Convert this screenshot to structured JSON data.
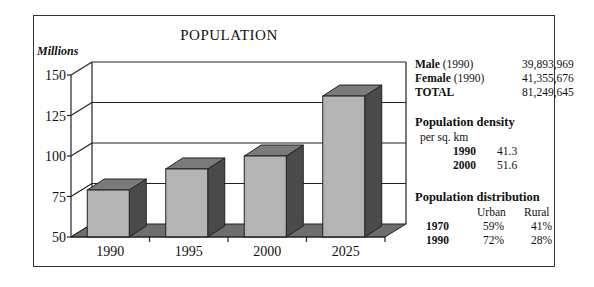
{
  "chart_data": {
    "type": "bar",
    "title": "POPULATION",
    "ylabel": "Millions",
    "xlabel": "",
    "categories": [
      "1990",
      "1995",
      "2000",
      "2025"
    ],
    "values": [
      79,
      92,
      100,
      137
    ],
    "ylim": [
      50,
      150
    ],
    "yticks": [
      50,
      75,
      100,
      125,
      150
    ],
    "grid": true,
    "style": "3d",
    "colors": {
      "front": "#b4b4b4",
      "top": "#7a7a7a",
      "side": "#4a4a4a",
      "floor": "#6e6e6e"
    }
  },
  "stats": {
    "male_label": "Male",
    "male_year": "(1990)",
    "male_value": "39,893,969",
    "female_label": "Female",
    "female_year": "(1990)",
    "female_value": "41,355,676",
    "total_label": "TOTAL",
    "total_value": "81,249,645"
  },
  "density": {
    "heading": "Population density",
    "unit": "per sq. km",
    "rows": [
      {
        "year": "1990",
        "value": "41.3"
      },
      {
        "year": "2000",
        "value": "51.6"
      }
    ]
  },
  "distribution": {
    "heading": "Population distribution",
    "col_urban": "Urban",
    "col_rural": "Rural",
    "rows": [
      {
        "year": "1970",
        "urban": "59%",
        "rural": "41%"
      },
      {
        "year": "1990",
        "urban": "72%",
        "rural": "28%"
      }
    ]
  }
}
